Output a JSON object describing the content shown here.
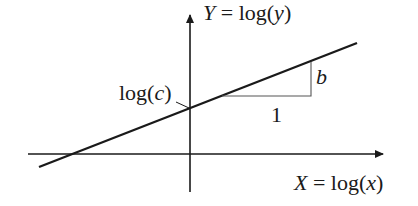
{
  "diagram": {
    "y_axis_label": {
      "var": "Y",
      "eq": " = log(",
      "arg": "y",
      "close": ")"
    },
    "x_axis_label": {
      "var": "X",
      "eq": " = log(",
      "arg": "x",
      "close": ")"
    },
    "intercept_label": {
      "pre": "log(",
      "arg": "c",
      "close": ")"
    },
    "slope_rise_label": "b",
    "slope_run_label": "1",
    "colors": {
      "line": "#1a1a1a",
      "axis": "#1a1a1a",
      "triangle": "#555555",
      "background": "#ffffff"
    }
  }
}
